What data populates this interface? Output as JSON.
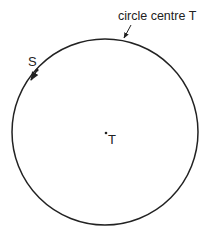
{
  "diagram": {
    "circle_label": "circle centre T",
    "point_s_label": "S",
    "centre_label": "T",
    "colors": {
      "stroke": "#222222",
      "background": "#ffffff"
    }
  }
}
